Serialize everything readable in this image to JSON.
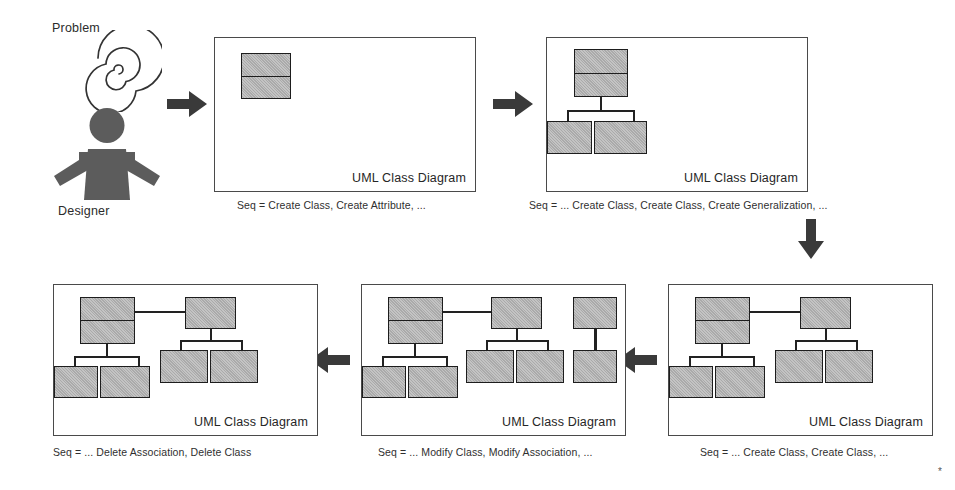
{
  "figure": {
    "actor": {
      "problem_label": "Problem",
      "designer_label": "Designer",
      "spiral_icon": "spiral-icon",
      "person_icon": "person-icon"
    },
    "panel_title": "UML Class Diagram",
    "steps": [
      {
        "id": "step-1",
        "caption": "Seq = Create Class, Create Attribute, ...",
        "title": "UML Class Diagram",
        "classes": 1,
        "description": "single class with two compartments"
      },
      {
        "id": "step-2",
        "caption": "Seq = ... Create Class, Create Class, Create Generalization, ...",
        "title": "UML Class Diagram",
        "classes": 3,
        "description": "one parent class generalized to two subclasses"
      },
      {
        "id": "step-3",
        "caption": "Seq = ... Create Class, Create Class, ...",
        "title": "UML Class Diagram",
        "classes": 6,
        "description": "two generalization hierarchies joined by an association"
      },
      {
        "id": "step-4",
        "caption": "Seq =  ... Modify Class, Modify Association, ...",
        "title": "UML Class Diagram",
        "classes": 8,
        "description": "hierarchies plus an extra linked class pair on the right"
      },
      {
        "id": "step-5",
        "caption": "Seq = ... Delete Association, Delete Class",
        "title": "UML Class Diagram",
        "classes": 6,
        "description": "association and extra class pair removed"
      }
    ],
    "arrows": [
      {
        "id": "arrow-actor-to-step1",
        "direction": "right"
      },
      {
        "id": "arrow-step1-to-step2",
        "direction": "right"
      },
      {
        "id": "arrow-step2-to-step3",
        "direction": "down"
      },
      {
        "id": "arrow-step3-to-step4",
        "direction": "left"
      },
      {
        "id": "arrow-step4-to-step5",
        "direction": "left"
      }
    ],
    "colors": {
      "class_fill": "#b3b3b3",
      "class_stroke": "#1d1d1d",
      "panel_stroke": "#4a4a4a",
      "arrow_fill": "#3a3a3a",
      "text": "#2b2b2b"
    },
    "footnote": "*"
  }
}
